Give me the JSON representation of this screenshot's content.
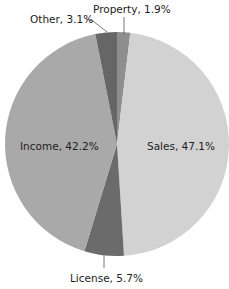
{
  "chart_data": {
    "type": "pie",
    "title": "",
    "start_angle_deg": 0,
    "direction": "clockwise",
    "slices": [
      {
        "name": "Property",
        "value": 1.9,
        "label": "Property, 1.9%",
        "color": "#8e8e8e"
      },
      {
        "name": "Sales",
        "value": 47.1,
        "label": "Sales, 47.1%",
        "color": "#d2d2d2"
      },
      {
        "name": "License",
        "value": 5.7,
        "label": "License, 5.7%",
        "color": "#6b6b6b"
      },
      {
        "name": "Income",
        "value": 42.2,
        "label": "Income, 42.2%",
        "color": "#a9a9a9"
      },
      {
        "name": "Other",
        "value": 3.1,
        "label": "Other, 3.1%",
        "color": "#666666"
      }
    ],
    "legend": "none",
    "labels_position": "inside for large slices, outside with leader lines for small slices"
  }
}
